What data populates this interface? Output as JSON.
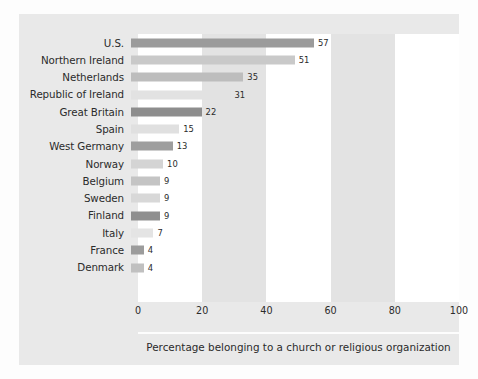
{
  "chart_data": {
    "type": "bar",
    "orientation": "horizontal",
    "title": "",
    "subtitle": "",
    "caption": "Percentage belonging to a church or religious organization",
    "xlabel": "",
    "ylabel": "",
    "xlim": [
      0,
      100
    ],
    "grid": false,
    "legend": null,
    "band_shading": true,
    "categories": [
      "U.S.",
      "Northern Ireland",
      "Netherlands",
      "Republic of Ireland",
      "Great Britain",
      "Spain",
      "West Germany",
      "Norway",
      "Belgium",
      "Sweden",
      "Finland",
      "Italy",
      "France",
      "Denmark"
    ],
    "values": [
      57,
      51,
      35,
      31,
      22,
      15,
      13,
      10,
      9,
      9,
      9,
      7,
      4,
      4
    ],
    "value_labels": [
      "57",
      "51",
      "35",
      "31",
      "22",
      "15",
      "13",
      "10",
      "9",
      "9",
      "9",
      "7",
      "4",
      "4"
    ],
    "bar_colors": [
      "#9b9b9b",
      "#c9c9c9",
      "#bdbdbd",
      "#e2e2e2",
      "#8d8d8d",
      "#e0e0e0",
      "#9e9e9e",
      "#d4d4d4",
      "#c4c4c4",
      "#d8d8d8",
      "#8f8f8f",
      "#e4e4e4",
      "#9c9c9c",
      "#c0c0c0"
    ],
    "xticks": [
      0,
      20,
      40,
      60,
      80,
      100
    ],
    "xtick_labels": [
      "0",
      "20",
      "40",
      "60",
      "80",
      "100"
    ],
    "bands": [
      {
        "from": 0,
        "to": 20,
        "color": "#ffffff"
      },
      {
        "from": 20,
        "to": 40,
        "color": "#e3e3e3"
      },
      {
        "from": 40,
        "to": 60,
        "color": "#ffffff"
      },
      {
        "from": 60,
        "to": 80,
        "color": "#e3e3e3"
      },
      {
        "from": 80,
        "to": 100,
        "color": "#ffffff"
      }
    ]
  },
  "colors": {
    "figure_background": "#fdfdfd",
    "panel_background": "#e9e9e9",
    "text": "#2b2b2b",
    "rule": "#fdfdfd"
  }
}
